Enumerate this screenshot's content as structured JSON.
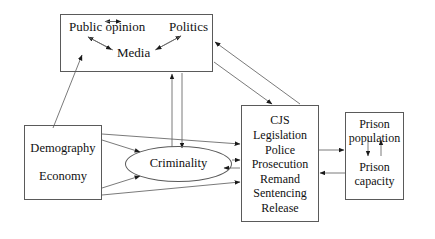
{
  "diagram": {
    "background": "#ffffff",
    "line_color": "#5a5a5a",
    "text_color": "#111111"
  },
  "nodes": {
    "social": {
      "public_opinion": "Public opinion",
      "politics": "Politics",
      "media": "Media"
    },
    "socio": {
      "demography": "Demography",
      "economy": "Economy"
    },
    "criminality": "Criminality",
    "cjs": {
      "lines": [
        "CJS",
        "Legislation",
        "Police",
        "Prosecution",
        "Remand",
        "Sentencing",
        "Release"
      ]
    },
    "prison": {
      "population": "Prison population",
      "capacity": "Prison capacity"
    }
  },
  "edges": [
    {
      "name": "public-opinion-politics",
      "direction": "both"
    },
    {
      "name": "public-opinion-media",
      "direction": "both"
    },
    {
      "name": "politics-media",
      "direction": "both"
    },
    {
      "name": "socio-to-social",
      "direction": "to-social"
    },
    {
      "name": "social-to-criminality",
      "direction": "to-criminality"
    },
    {
      "name": "criminality-to-social",
      "direction": "to-social"
    },
    {
      "name": "social-to-cjs",
      "direction": "to-cjs"
    },
    {
      "name": "cjs-to-social",
      "direction": "to-social"
    },
    {
      "name": "socio-to-criminality-upper",
      "direction": "to-criminality"
    },
    {
      "name": "socio-to-criminality-lower",
      "direction": "to-criminality"
    },
    {
      "name": "socio-to-cjs-upper",
      "direction": "to-cjs"
    },
    {
      "name": "socio-to-cjs-lower",
      "direction": "to-cjs"
    },
    {
      "name": "criminality-to-cjs",
      "direction": "to-cjs"
    },
    {
      "name": "cjs-to-criminality",
      "direction": "to-criminality"
    },
    {
      "name": "cjs-to-prison",
      "direction": "to-prison"
    },
    {
      "name": "prison-to-cjs",
      "direction": "to-cjs"
    },
    {
      "name": "population-to-capacity",
      "direction": "down"
    },
    {
      "name": "capacity-to-population",
      "direction": "up"
    }
  ]
}
